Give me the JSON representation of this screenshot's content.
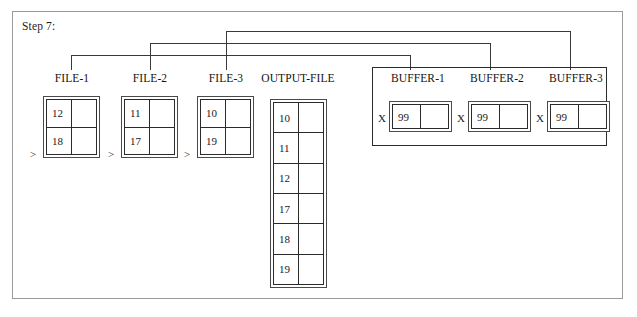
{
  "diagram": {
    "step_caption": "Step 7:",
    "frame_color": "#9a9a9a",
    "line_color": "#2b2b2b"
  },
  "files": [
    {
      "label": "FILE-1",
      "caret": ">",
      "rows": [
        {
          "left": "12",
          "right": ""
        },
        {
          "left": "18",
          "right": ""
        }
      ]
    },
    {
      "label": "FILE-2",
      "caret": ">",
      "rows": [
        {
          "left": "11",
          "right": ""
        },
        {
          "left": "17",
          "right": ""
        }
      ]
    },
    {
      "label": "FILE-3",
      "caret": ">",
      "rows": [
        {
          "left": "10",
          "right": ""
        },
        {
          "left": "19",
          "right": ""
        }
      ]
    }
  ],
  "output_file": {
    "label": "OUTPUT-FILE",
    "rows": [
      {
        "left": "10",
        "right": ""
      },
      {
        "left": "11",
        "right": ""
      },
      {
        "left": "12",
        "right": ""
      },
      {
        "left": "17",
        "right": ""
      },
      {
        "left": "18",
        "right": ""
      },
      {
        "left": "19",
        "right": ""
      }
    ]
  },
  "buffers": [
    {
      "label": "BUFFER-1",
      "marker": "X",
      "rows": [
        {
          "left": "99",
          "right": ""
        }
      ]
    },
    {
      "label": "BUFFER-2",
      "marker": "X",
      "rows": [
        {
          "left": "99",
          "right": ""
        }
      ]
    },
    {
      "label": "BUFFER-3",
      "marker": "X",
      "rows": [
        {
          "left": "99",
          "right": ""
        }
      ]
    }
  ]
}
